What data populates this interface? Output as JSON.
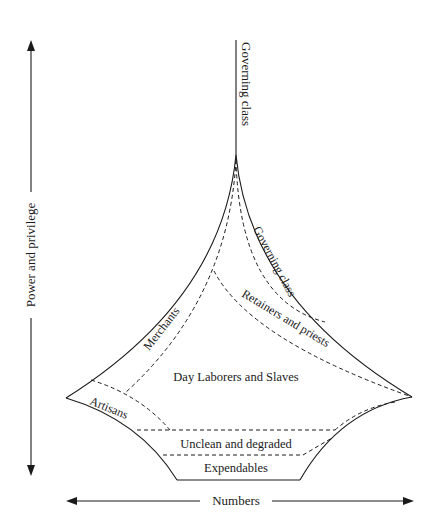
{
  "diagram": {
    "type": "social-stratification-diagram",
    "axes": {
      "vertical_label": "Power and privilege",
      "horizontal_label": "Numbers"
    },
    "strata": [
      {
        "label": "Governing class",
        "position": "top-vertical-line"
      },
      {
        "label": "Governing class",
        "position": "upper-right-band"
      },
      {
        "label": "Retainers and priests",
        "position": "right-band"
      },
      {
        "label": "Merchants",
        "position": "upper-left-band"
      },
      {
        "label": "Day Laborers and Slaves",
        "position": "center"
      },
      {
        "label": "Artisans",
        "position": "left-tip"
      },
      {
        "label": "Unclean and degraded",
        "position": "lower-band"
      },
      {
        "label": "Expendables",
        "position": "bottom"
      }
    ],
    "stroke_color": "#1a1a1a",
    "background": "#ffffff"
  }
}
